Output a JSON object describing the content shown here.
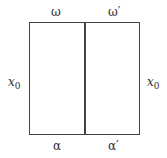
{
  "diagram": {
    "top_labels": [
      "ω",
      "ω′"
    ],
    "bottom_labels": [
      "α",
      "α′"
    ],
    "side_labels": {
      "left": {
        "main": "x",
        "sub": "0"
      },
      "right": {
        "main": "x",
        "sub": "0"
      }
    },
    "line_color": "#444444"
  }
}
